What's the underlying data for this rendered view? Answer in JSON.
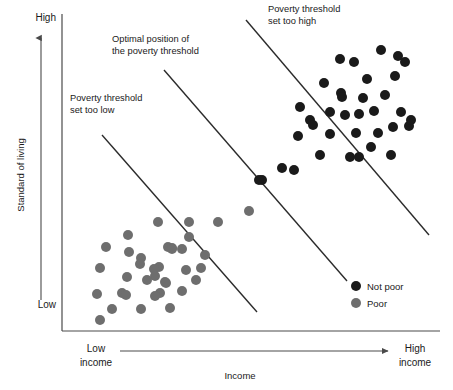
{
  "figure": {
    "width": 453,
    "height": 390,
    "background": "#ffffff"
  },
  "chart_data": {
    "type": "scatter",
    "title": "",
    "xlabel": "Income",
    "ylabel": "Standard of living",
    "grid": false,
    "axis_labels": {
      "y_high": "High",
      "y_low": "Low",
      "x_low_line1": "Low",
      "x_low_line2": "income",
      "x_high_line1": "High",
      "x_high_line2": "income"
    },
    "xlim": [
      0,
      100
    ],
    "ylim": [
      0,
      100
    ],
    "legend": {
      "position": "bottom-right",
      "entries": [
        {
          "name": "Not poor",
          "color": "#1a1a1a"
        },
        {
          "name": "Poor",
          "color": "#6e6e6e"
        }
      ]
    },
    "annotations": [
      {
        "id": "threshold-too-low",
        "lines": [
          "Poverty threshold",
          "set too low"
        ],
        "x": 70,
        "y": 101
      },
      {
        "id": "threshold-optimal",
        "lines": [
          "Optimal position of",
          "the poverty threshold"
        ],
        "x": 112,
        "y": 42
      },
      {
        "id": "threshold-too-high",
        "lines": [
          "Poverty threshold",
          "set too high"
        ],
        "x": 268,
        "y": 12
      }
    ],
    "threshold_lines": [
      {
        "id": "too-low",
        "x1": 102,
        "y1": 135,
        "x2": 257,
        "y2": 312
      },
      {
        "id": "optimal",
        "x1": 164,
        "y1": 70,
        "x2": 347,
        "y2": 281
      },
      {
        "id": "too-high",
        "x1": 246,
        "y1": 20,
        "x2": 429,
        "y2": 235
      }
    ],
    "series": [
      {
        "name": "Not poor",
        "color": "#1a1a1a",
        "marker": "circle",
        "radius": 5.0,
        "points": [
          [
            381,
            50
          ],
          [
            340,
            59
          ],
          [
            354,
            62
          ],
          [
            367,
            79
          ],
          [
            395,
            76
          ],
          [
            405,
            62
          ],
          [
            324,
            83
          ],
          [
            398,
            56
          ],
          [
            341,
            93
          ],
          [
            342,
            97
          ],
          [
            300,
            107
          ],
          [
            310,
            120
          ],
          [
            363,
            98
          ],
          [
            385,
            95
          ],
          [
            374,
            111
          ],
          [
            401,
            112
          ],
          [
            313,
            125
          ],
          [
            330,
            112
          ],
          [
            359,
            114
          ],
          [
            393,
            127
          ],
          [
            409,
            126
          ],
          [
            298,
            136
          ],
          [
            345,
            115
          ],
          [
            330,
            134
          ],
          [
            356,
            133
          ],
          [
            378,
            133
          ],
          [
            411,
            120
          ],
          [
            371,
            147
          ],
          [
            391,
            155
          ],
          [
            320,
            155
          ],
          [
            350,
            157
          ],
          [
            359,
            157
          ],
          [
            282,
            168
          ],
          [
            294,
            170
          ],
          [
            262,
            180
          ],
          [
            259,
            180
          ]
        ]
      },
      {
        "name": "Poor",
        "color": "#6e6e6e",
        "marker": "circle",
        "radius": 5.0,
        "points": [
          [
            158,
            222
          ],
          [
            189,
            222
          ],
          [
            218,
            222
          ],
          [
            249,
            211
          ],
          [
            128,
            235
          ],
          [
            106,
            247
          ],
          [
            100,
            268
          ],
          [
            141,
            258
          ],
          [
            159,
            267
          ],
          [
            140,
            264
          ],
          [
            154,
            269
          ],
          [
            155,
            276
          ],
          [
            168,
            247
          ],
          [
            172,
            248
          ],
          [
            182,
            249
          ],
          [
            127,
            277
          ],
          [
            165,
            282
          ],
          [
            166,
            283
          ],
          [
            172,
            249
          ],
          [
            147,
            280
          ],
          [
            186,
            270
          ],
          [
            196,
            280
          ],
          [
            201,
            268
          ],
          [
            122,
            293
          ],
          [
            126,
            295
          ],
          [
            160,
            293
          ],
          [
            182,
            291
          ],
          [
            155,
            296
          ],
          [
            97,
            294
          ],
          [
            112,
            309
          ],
          [
            141,
            309
          ],
          [
            170,
            308
          ],
          [
            100,
            320
          ],
          [
            129,
            252
          ],
          [
            205,
            255
          ],
          [
            189,
            237
          ]
        ]
      }
    ]
  },
  "axes": {
    "y_axis": {
      "x": 62,
      "y_top": 14,
      "y_bottom": 331
    },
    "x_axis": {
      "y": 331,
      "x_left": 62,
      "x_right": 440
    },
    "y_arrow": {
      "x": 41,
      "y_top": 38,
      "y_bottom": 300
    },
    "x_arrow": {
      "y": 351,
      "x_left": 120,
      "x_right": 388
    }
  }
}
